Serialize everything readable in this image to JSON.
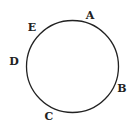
{
  "diagram": {
    "type": "circle-with-labeled-points",
    "stroke_color": "#222222",
    "background": "#ffffff",
    "circle": {
      "cx": 72.5,
      "cy": 66.5,
      "r": 46
    },
    "points": [
      {
        "label": "A",
        "x": 90,
        "y": 19
      },
      {
        "label": "B",
        "x": 122,
        "y": 92
      },
      {
        "label": "C",
        "x": 49,
        "y": 120
      },
      {
        "label": "D",
        "x": 14,
        "y": 65
      },
      {
        "label": "E",
        "x": 32,
        "y": 31
      }
    ]
  }
}
